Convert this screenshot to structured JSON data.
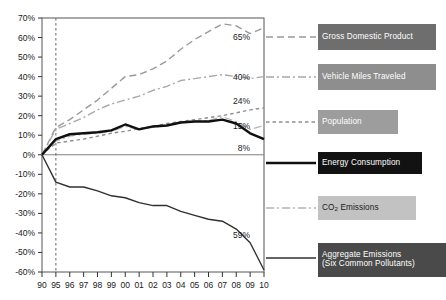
{
  "chart_data": {
    "type": "line",
    "title": "",
    "xlabel": "",
    "ylabel": "",
    "x": [
      1990,
      1995,
      1996,
      1997,
      1998,
      1999,
      2000,
      2001,
      2002,
      2003,
      2004,
      2005,
      2006,
      2007,
      2008,
      2009,
      2010
    ],
    "xticklabels": [
      "90",
      "95",
      "96",
      "97",
      "98",
      "99",
      "00",
      "01",
      "02",
      "03",
      "04",
      "05",
      "06",
      "07",
      "08",
      "09",
      "10"
    ],
    "yticklabels": [
      "70%",
      "60%",
      "50%",
      "40%",
      "30%",
      "20%",
      "10%",
      "0%",
      "-10%",
      "-20%",
      "-30%",
      "-40%",
      "-50%",
      "-60%"
    ],
    "yticks": [
      70,
      60,
      50,
      40,
      30,
      20,
      10,
      0,
      -10,
      -20,
      -30,
      -40,
      -50,
      -60
    ],
    "ylim": [
      -60,
      70
    ],
    "grid": false,
    "legend_position": "right",
    "reference_line_x": 1995,
    "zero_line": 0,
    "series": [
      {
        "name": "Gross Domestic Product",
        "key": "gdp",
        "color": "#9a9a9a",
        "style": "long-dash",
        "width": 1.4,
        "end_label": "65%",
        "values": [
          0,
          14,
          18,
          23,
          28,
          34,
          40,
          41,
          44,
          48,
          54,
          59,
          63,
          67,
          66,
          62,
          65
        ]
      },
      {
        "name": "Vehicle Miles Traveled",
        "key": "vmt",
        "color": "#a8a8a8",
        "style": "dash-dot",
        "width": 1.4,
        "end_label": "40%",
        "values": [
          0,
          13,
          16,
          19,
          23,
          26,
          28,
          30,
          33,
          35,
          38,
          39,
          40,
          41,
          40,
          39,
          40
        ]
      },
      {
        "name": "Population",
        "key": "population",
        "color": "#8f8f8f",
        "style": "short-dash",
        "width": 1.4,
        "end_label": "24%",
        "values": [
          0,
          6,
          7,
          8,
          9.5,
          11,
          12,
          13.5,
          14.5,
          16,
          17,
          18,
          19,
          20,
          21.5,
          23,
          24
        ]
      },
      {
        "name": "Energy Consumption",
        "key": "energy",
        "color": "#101010",
        "style": "solid-thick",
        "width": 2.4,
        "end_label": "8%",
        "values": [
          0,
          8,
          10.5,
          11,
          11.5,
          12.5,
          15.5,
          13,
          14.5,
          15,
          16.5,
          17,
          17,
          18,
          16,
          11,
          8
        ]
      },
      {
        "name": "CO2 Emissions",
        "key": "co2",
        "color": "#b4b4b4",
        "style": "dash-dot",
        "width": 1.3,
        "end_label": "15%",
        "values": [
          0,
          7,
          9.5,
          10.5,
          11,
          12,
          14.5,
          13,
          14,
          15,
          16.5,
          17.5,
          17.5,
          19.5,
          17,
          13,
          15
        ]
      },
      {
        "name": "Aggregate Emissions (Six Common Pollutants)",
        "key": "aggregate",
        "color": "#303030",
        "style": "solid-thin",
        "width": 1.4,
        "end_label": "59%",
        "values": [
          0,
          -14,
          -16.5,
          -16.5,
          -18.5,
          -21,
          -22,
          -24.5,
          -26,
          -26,
          -29,
          -31,
          -33,
          -34,
          -38,
          -45,
          -59
        ]
      }
    ]
  },
  "legend": {
    "items": [
      {
        "label": "Gross Domestic Product",
        "key": "gdp",
        "box_bg": "#6e6e6e",
        "text_color": "#ffffff"
      },
      {
        "label": "Vehicle Miles Traveled",
        "key": "vmt",
        "box_bg": "#8e8e8e",
        "text_color": "#ffffff"
      },
      {
        "label": "Population",
        "key": "population",
        "box_bg": "#9d9d9d",
        "text_color": "#ffffff"
      },
      {
        "label": "Energy Consumption",
        "key": "energy",
        "box_bg": "#121212",
        "text_color": "#ffffff"
      },
      {
        "label": "CO2 Emissions",
        "key": "co2",
        "box_bg": "#c2c2c2",
        "text_color": "#1a1a1a"
      },
      {
        "label": "Aggregate Emissions (Six Common Pollutants)",
        "key": "aggregate",
        "box_bg": "#4a4a4a",
        "text_color": "#ffffff"
      }
    ]
  }
}
